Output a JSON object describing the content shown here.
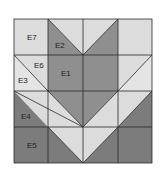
{
  "diagram": {
    "type": "quilt-block",
    "grid": {
      "rows": 4,
      "cols": 4
    },
    "colors": {
      "light": "#dcdcdc",
      "lighter": "#e4e4e4",
      "medium": "#8f8f8f",
      "dark": "#7c7c7c",
      "line": "#2a2a2a",
      "label": "#222222"
    },
    "labels": {
      "e7": "E7",
      "e2": "E2",
      "e6": "E6",
      "e1": "E1",
      "e3": "E3",
      "e4": "E4",
      "e5": "E5"
    }
  }
}
